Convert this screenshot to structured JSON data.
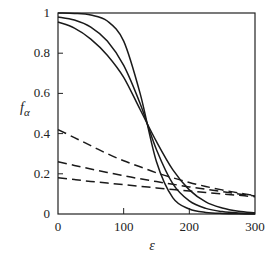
{
  "chart_data": {
    "type": "line",
    "title": "",
    "xlabel": "ε",
    "ylabel": "f_α",
    "xlim": [
      0,
      300
    ],
    "ylim": [
      0,
      1
    ],
    "x_ticks": [
      0,
      100,
      200,
      300
    ],
    "y_ticks": [
      0,
      0.2,
      0.4,
      0.6,
      0.8,
      1
    ],
    "x_tick_labels": [
      "0",
      "100",
      "200",
      "300"
    ],
    "y_tick_labels": [
      "0",
      "0.2",
      "0.4",
      "0.6",
      "0.8",
      "1"
    ],
    "grid": false,
    "legend": null,
    "x": [
      0,
      25,
      50,
      75,
      100,
      125,
      150,
      175,
      200,
      225,
      250,
      275,
      300
    ],
    "series": [
      {
        "name": "solid-1",
        "style": "solid",
        "values": [
          1.0,
          0.998,
          0.99,
          0.96,
          0.86,
          0.6,
          0.26,
          0.08,
          0.025,
          0.008,
          0.003,
          0.001,
          0.0
        ]
      },
      {
        "name": "solid-2",
        "style": "solid",
        "values": [
          0.98,
          0.965,
          0.93,
          0.86,
          0.74,
          0.55,
          0.32,
          0.15,
          0.065,
          0.028,
          0.012,
          0.005,
          0.002
        ]
      },
      {
        "name": "solid-3",
        "style": "solid",
        "values": [
          0.955,
          0.925,
          0.87,
          0.79,
          0.68,
          0.52,
          0.36,
          0.22,
          0.12,
          0.06,
          0.03,
          0.014,
          0.006
        ]
      },
      {
        "name": "dashed-1",
        "style": "dashed",
        "values": [
          0.42,
          0.38,
          0.34,
          0.3,
          0.265,
          0.235,
          0.205,
          0.18,
          0.157,
          0.137,
          0.12,
          0.105,
          0.092
        ]
      },
      {
        "name": "dashed-2",
        "style": "dashed",
        "values": [
          0.26,
          0.242,
          0.224,
          0.207,
          0.19,
          0.175,
          0.161,
          0.148,
          0.135,
          0.123,
          0.112,
          0.1,
          0.09
        ]
      },
      {
        "name": "dashed-3",
        "style": "dashed",
        "values": [
          0.18,
          0.171,
          0.162,
          0.154,
          0.146,
          0.138,
          0.13,
          0.122,
          0.115,
          0.107,
          0.1,
          0.093,
          0.086
        ]
      }
    ]
  },
  "labels": {
    "ylabel_main": "f",
    "ylabel_sub": "α",
    "xlabel": "ε"
  }
}
